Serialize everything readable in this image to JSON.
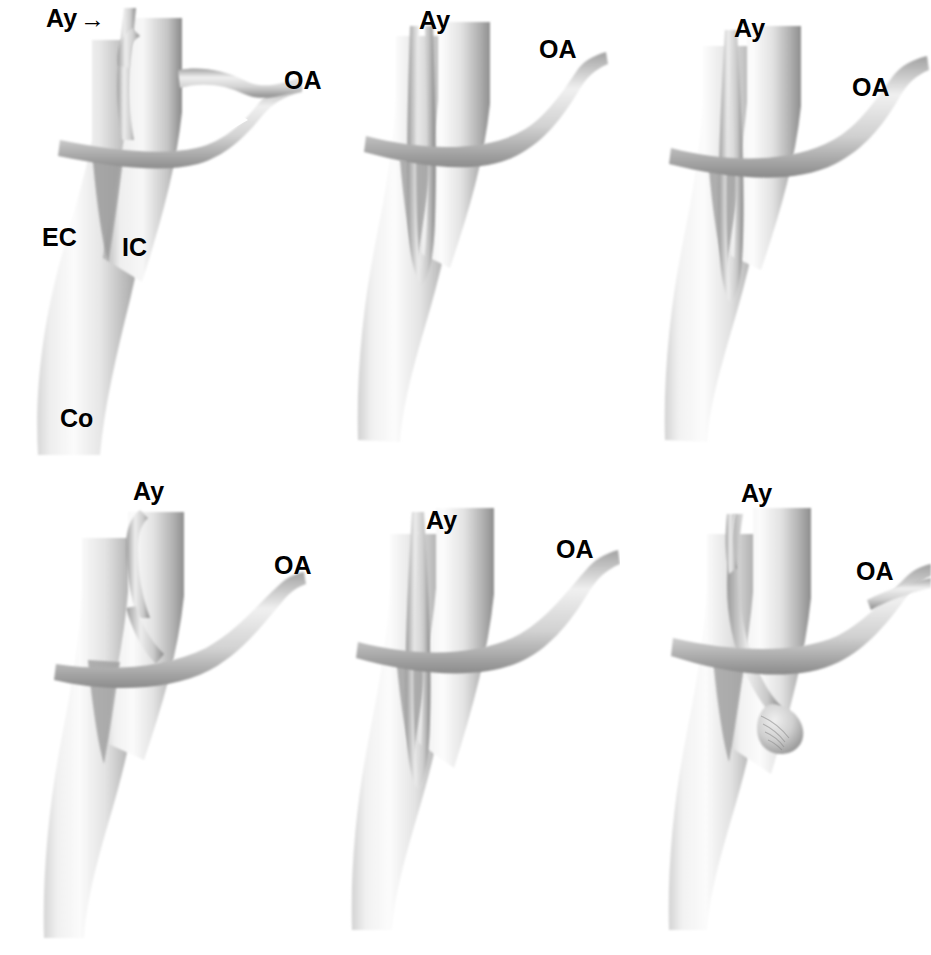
{
  "figure": {
    "type": "anatomical-illustration-grid",
    "background_color": "#ffffff",
    "ink_color": "#000000",
    "vessel_fill_light": "#f2f2f2",
    "vessel_fill_mid": "#b9b9b9",
    "vessel_fill_dark": "#6e6e6e",
    "rows": 2,
    "columns": 3,
    "total_panels": 6
  },
  "labels": {
    "ay": "Ay",
    "oa": "OA",
    "ec": "EC",
    "ic": "IC",
    "co": "Co",
    "arrow": "→"
  },
  "panels": [
    {
      "id": "panel-1",
      "index": 1,
      "row": 1,
      "column": 1,
      "labels": [
        "Ay",
        "OA",
        "EC",
        "IC",
        "Co"
      ],
      "has_arrow": true,
      "description": "Common carotid bifurcating into external and internal carotid; occipital artery arises from external carotid and loops over internal carotid; anomalous artery (Ay) ascends anteriorly from the occipital artery arch",
      "annotations": [
        {
          "name": "Ay",
          "x": 46,
          "y": 8,
          "arrow": true
        },
        {
          "name": "OA",
          "x": 283,
          "y": 70,
          "arrow": false
        },
        {
          "name": "EC",
          "x": 42,
          "y": 225,
          "arrow": false
        },
        {
          "name": "IC",
          "x": 122,
          "y": 235,
          "arrow": false
        },
        {
          "name": "Co",
          "x": 60,
          "y": 405,
          "arrow": false
        }
      ]
    },
    {
      "id": "panel-2",
      "index": 2,
      "row": 1,
      "column": 2,
      "labels": [
        "Ay",
        "OA"
      ],
      "has_arrow": false,
      "description": "Anomalous artery descends as a long narrow loop within the carotid fork, joining the occipital artery which crosses the internal carotid",
      "annotations": [
        {
          "name": "Ay",
          "x": 418,
          "y": 10,
          "arrow": false
        },
        {
          "name": "OA",
          "x": 538,
          "y": 38,
          "arrow": false
        }
      ]
    },
    {
      "id": "panel-3",
      "index": 3,
      "row": 1,
      "column": 3,
      "labels": [
        "Ay",
        "OA"
      ],
      "has_arrow": false,
      "description": "Long descending anomalous loop reaching deep into the bifurcation with occipital artery passing laterally",
      "annotations": [
        {
          "name": "Ay",
          "x": 733,
          "y": 18,
          "arrow": false
        },
        {
          "name": "OA",
          "x": 851,
          "y": 76,
          "arrow": false
        }
      ]
    },
    {
      "id": "panel-4",
      "index": 4,
      "row": 2,
      "column": 1,
      "labels": [
        "Ay",
        "OA"
      ],
      "has_arrow": false,
      "description": "Short anomalous artery arising from the occipital arch and ascending alongside the internal carotid",
      "annotations": [
        {
          "name": "Ay",
          "x": 133,
          "y": 480,
          "arrow": false
        },
        {
          "name": "OA",
          "x": 273,
          "y": 555,
          "arrow": false
        }
      ]
    },
    {
      "id": "panel-5",
      "index": 5,
      "row": 2,
      "column": 2,
      "labels": [
        "Ay",
        "OA"
      ],
      "has_arrow": false,
      "description": "Narrow elongated anomalous loop descending into the carotid fork with occipital artery crossing anteriorly",
      "annotations": [
        {
          "name": "Ay",
          "x": 425,
          "y": 510,
          "arrow": false
        },
        {
          "name": "OA",
          "x": 555,
          "y": 538,
          "arrow": false
        }
      ]
    },
    {
      "id": "panel-6",
      "index": 6,
      "row": 2,
      "column": 3,
      "labels": [
        "Ay",
        "OA"
      ],
      "has_arrow": false,
      "description": "Anomalous artery ending in a blind saccular aneurysm-like pouch against the internal carotid wall",
      "annotations": [
        {
          "name": "Ay",
          "x": 740,
          "y": 482,
          "arrow": false
        },
        {
          "name": "OA",
          "x": 855,
          "y": 560,
          "arrow": false
        }
      ]
    }
  ]
}
